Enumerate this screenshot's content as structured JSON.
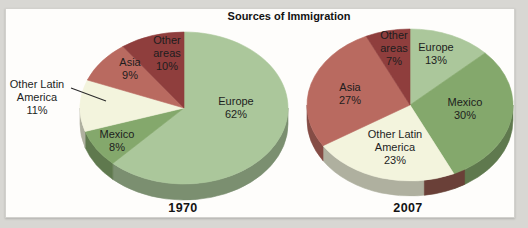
{
  "chart_data": {
    "type": "pie",
    "title": "Sources of Immigration",
    "start_angle_deg": 0,
    "direction": "clockwise",
    "text_color": "#1d1d1d",
    "pies": [
      {
        "year_label": "1970",
        "center": [
          184,
          108
        ],
        "radius": [
          104,
          76
        ],
        "depth": 16,
        "slices": [
          {
            "label": "Europe",
            "value": 62,
            "color": "#abc79b",
            "label_lines": [
              "Europe",
              "62%"
            ],
            "label_pos": [
              236,
              108
            ],
            "outside": false
          },
          {
            "label": "Mexico",
            "value": 8,
            "color": "#84a86c",
            "label_lines": [
              "Mexico",
              "8%"
            ],
            "label_pos": [
              117,
              141
            ],
            "outside": false
          },
          {
            "label": "Other Latin America",
            "value": 11,
            "color": "#f3f4dd",
            "label_lines": [
              "Other Latin",
              "America",
              "11%"
            ],
            "label_pos": [
              37,
              97
            ],
            "outside": true,
            "leader": [
              [
                71,
                88
              ],
              [
                106,
                101
              ]
            ]
          },
          {
            "label": "Asia",
            "value": 9,
            "color": "#b96a60",
            "label_lines": [
              "Asia",
              "9%"
            ],
            "label_pos": [
              130,
              69
            ],
            "outside": false
          },
          {
            "label": "Other areas",
            "value": 10,
            "color": "#8f3e3d",
            "label_lines": [
              "Other",
              "areas",
              "10%"
            ],
            "label_pos": [
              167,
              53
            ],
            "outside": false
          }
        ]
      },
      {
        "year_label": "2007",
        "center": [
          410,
          105
        ],
        "radius": [
          103,
          76
        ],
        "depth": 15,
        "rim_overlays": [
          {
            "from": 148,
            "to": 172,
            "color": "#6a4038"
          }
        ],
        "slices": [
          {
            "label": "Europe",
            "value": 13,
            "color": "#abc79b",
            "label_lines": [
              "Europe",
              "13%"
            ],
            "label_pos": [
              436,
              54
            ],
            "outside": false
          },
          {
            "label": "Mexico",
            "value": 30,
            "color": "#84a86c",
            "label_lines": [
              "Mexico",
              "30%"
            ],
            "label_pos": [
              465,
              109
            ],
            "outside": false
          },
          {
            "label": "Other Latin America",
            "value": 23,
            "color": "#f3f4dd",
            "label_lines": [
              "Other Latin",
              "America",
              "23%"
            ],
            "label_pos": [
              395,
              147
            ],
            "outside": false
          },
          {
            "label": "Asia",
            "value": 27,
            "color": "#b96a60",
            "label_lines": [
              "Asia",
              "27%"
            ],
            "label_pos": [
              350,
              94
            ],
            "outside": false
          },
          {
            "label": "Other areas",
            "value": 7,
            "color": "#8f3e3d",
            "label_lines": [
              "Other",
              "areas",
              "7%"
            ],
            "label_pos": [
              394,
              48
            ],
            "outside": false
          }
        ]
      }
    ]
  }
}
